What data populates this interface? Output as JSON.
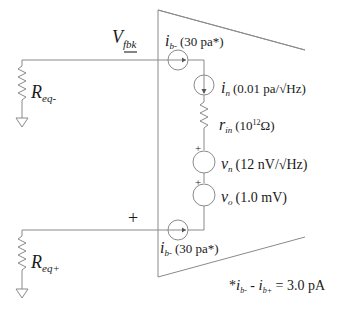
{
  "diagram": {
    "left_inverting": {
      "node_label": "V",
      "node_label_sub": "fbk",
      "polarity": "−",
      "resistor_label": "R",
      "resistor_sub": "eq-"
    },
    "left_noninverting": {
      "polarity": "+",
      "resistor_label": "R",
      "resistor_sub": "eq+"
    },
    "sources": {
      "ib_minus": {
        "symbol": "i",
        "sub": "b-",
        "value": "(30 pa*)"
      },
      "ib_plus": {
        "symbol": "i",
        "sub": "b-",
        "value": "(30 pa*)"
      },
      "in": {
        "symbol": "i",
        "sub": "n",
        "value": "(0.01 pa/√Hz)"
      },
      "rin": {
        "symbol": "r",
        "sub": "in",
        "value_prefix": "(10",
        "value_exp": "12",
        "value_suffix": "Ω)"
      },
      "vn": {
        "symbol": "v",
        "sub": "n",
        "value": "(12 nV/√Hz)",
        "plus": "+"
      },
      "vo": {
        "symbol": "v",
        "sub": "o",
        "value": "(1.0 mV)",
        "plus": "+"
      }
    },
    "footnote": {
      "star": "*",
      "i1": "i",
      "i1_sub": "b-",
      "minus": " - ",
      "i2": "i",
      "i2_sub": "b+",
      "result": " = 3.0 pA"
    },
    "colors": {
      "wire": "#8a8a8a",
      "text": "#1a1a1a",
      "background": "#ffffff"
    }
  }
}
